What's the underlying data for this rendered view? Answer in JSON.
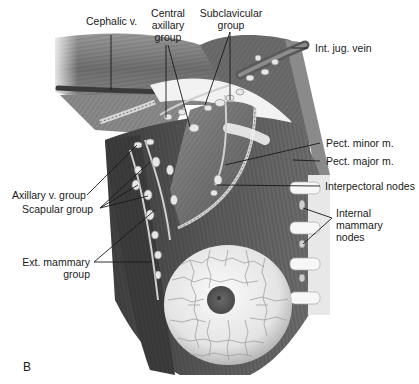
{
  "figure": {
    "panel_letter": "B",
    "colors": {
      "background": "#ffffff",
      "muscle_dark": "#4a4a4a",
      "muscle_mid": "#7a7a7a",
      "muscle_light": "#b5b5b5",
      "breast_fill": "#ececec",
      "breast_lobule_lines": "#9a9a9a",
      "areola": "#5e5e5e",
      "node_fill": "#e6e6e6",
      "leader_line": "#1a1a1a"
    }
  },
  "labels": {
    "cephalic_v": "Cephalic v.",
    "central_axillary_line1": "Central",
    "central_axillary_line2": "axillary",
    "central_axillary_line3": "group",
    "subclavicular_line1": "Subclavicular",
    "subclavicular_line2": "group",
    "int_jug_vein": "Int. jug. vein",
    "pect_minor": "Pect. minor m.",
    "pect_major": "Pect. major m.",
    "interpectoral_nodes": "Interpectoral nodes",
    "internal_mammary_line1": "Internal",
    "internal_mammary_line2": "mammary",
    "internal_mammary_line3": "nodes",
    "axillary_v_group": "Axillary v. group",
    "scapular_group": "Scapular group",
    "ext_mammary_line1": "Ext. mammary",
    "ext_mammary_line2": "group"
  }
}
